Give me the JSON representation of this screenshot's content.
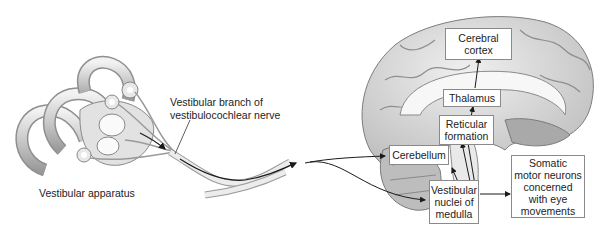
{
  "diagram": {
    "labels": {
      "vestibular_apparatus": "Vestibular apparatus",
      "nerve_line1": "Vestibular branch of",
      "nerve_line2": "vestibulocochlear nerve"
    },
    "boxes": {
      "cerebral_cortex": [
        "Cerebral",
        "cortex"
      ],
      "thalamus": [
        "Thalamus"
      ],
      "reticular_formation": [
        "Reticular",
        "formation"
      ],
      "cerebellum": [
        "Cerebellum"
      ],
      "vestibular_nuclei": [
        "Vestibular",
        "nuclei of",
        "medulla"
      ],
      "somatic_motor": [
        "Somatic",
        "motor neurons",
        "concerned",
        "with eye",
        "movements"
      ]
    },
    "colors": {
      "arrow": "#1a1a1a",
      "box_border": "#8a8a8a",
      "illustration": "#d9d9d9"
    }
  }
}
